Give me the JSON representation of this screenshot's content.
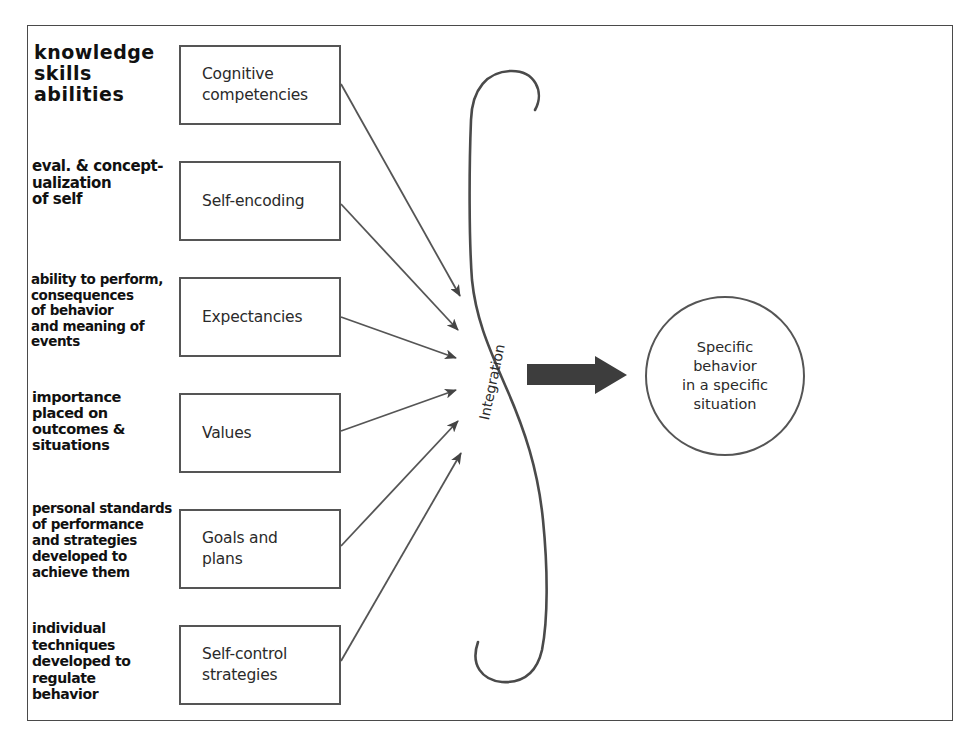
{
  "diagram": {
    "factors": [
      {
        "id": "cognitive-competencies",
        "label": "Cognitive\ncompetencies",
        "top": 45
      },
      {
        "id": "self-encoding",
        "label": "Self-encoding",
        "top": 161
      },
      {
        "id": "expectancies",
        "label": "Expectancies",
        "top": 277
      },
      {
        "id": "values",
        "label": "Values",
        "top": 393
      },
      {
        "id": "goals-and-plans",
        "label": "Goals and\nplans",
        "top": 509
      },
      {
        "id": "self-control-strategies",
        "label": "Self-control\nstrategies",
        "top": 625
      }
    ],
    "handwritten_notes": [
      {
        "id": "note-cognitive",
        "text": "knowledge\nskills\nabilities"
      },
      {
        "id": "note-self-encoding",
        "text": "eval. & concept-\nualization\nof self"
      },
      {
        "id": "note-expectancies",
        "text": "ability to perform,\nconsequences\nof behavior\nand meaning of\nevents"
      },
      {
        "id": "note-values",
        "text": "importance\nplaced on\noutcomes &\nsituations"
      },
      {
        "id": "note-goals",
        "text": "personal standards\nof performance\nand strategies\ndeveloped to\nachieve them"
      },
      {
        "id": "note-self-control",
        "text": "individual\ntechniques\ndeveloped to\nregulate\nbehavior"
      }
    ],
    "integration_label": "Integration",
    "outcome_label": "Specific\nbehavior\nin a specific\nsituation",
    "colors": {
      "line": "#555555",
      "arrow_fill": "#4a4a4a",
      "big_arrow": "#3d3d3d",
      "text": "#2a2a2a",
      "handwriting": "#111111"
    }
  }
}
